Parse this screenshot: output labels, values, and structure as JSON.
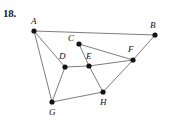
{
  "figure": {
    "problem_number": "18.",
    "width": 169,
    "height": 124,
    "background_color": "#ffffff",
    "edge_color": "#6e6e6e",
    "vertex_color": "#141414",
    "label_color": "#111111",
    "vertex_radius": 2.6,
    "edge_width": 0.9
  },
  "graph": {
    "vertices": [
      {
        "id": "A",
        "label": "A",
        "x": 34,
        "y": 31,
        "label_x": 31,
        "label_y": 17
      },
      {
        "id": "B",
        "label": "B",
        "x": 155,
        "y": 35,
        "label_x": 150,
        "label_y": 21
      },
      {
        "id": "C",
        "label": "C",
        "x": 79,
        "y": 44,
        "label_x": 68,
        "label_y": 34
      },
      {
        "id": "D",
        "label": "D",
        "x": 65,
        "y": 67,
        "label_x": 59,
        "label_y": 52
      },
      {
        "id": "E",
        "label": "E",
        "x": 89,
        "y": 66,
        "label_x": 86,
        "label_y": 52
      },
      {
        "id": "F",
        "label": "F",
        "x": 133,
        "y": 60,
        "label_x": 128,
        "label_y": 45
      },
      {
        "id": "G",
        "label": "G",
        "x": 52,
        "y": 102,
        "label_x": 49,
        "label_y": 108
      },
      {
        "id": "H",
        "label": "H",
        "x": 103,
        "y": 92,
        "label_x": 100,
        "label_y": 98
      }
    ],
    "edges": [
      {
        "from": "A",
        "to": "B"
      },
      {
        "from": "A",
        "to": "D"
      },
      {
        "from": "A",
        "to": "G"
      },
      {
        "from": "B",
        "to": "F"
      },
      {
        "from": "C",
        "to": "E"
      },
      {
        "from": "C",
        "to": "F"
      },
      {
        "from": "D",
        "to": "E"
      },
      {
        "from": "D",
        "to": "G"
      },
      {
        "from": "E",
        "to": "F"
      },
      {
        "from": "E",
        "to": "H"
      },
      {
        "from": "F",
        "to": "H"
      },
      {
        "from": "G",
        "to": "H"
      }
    ]
  }
}
